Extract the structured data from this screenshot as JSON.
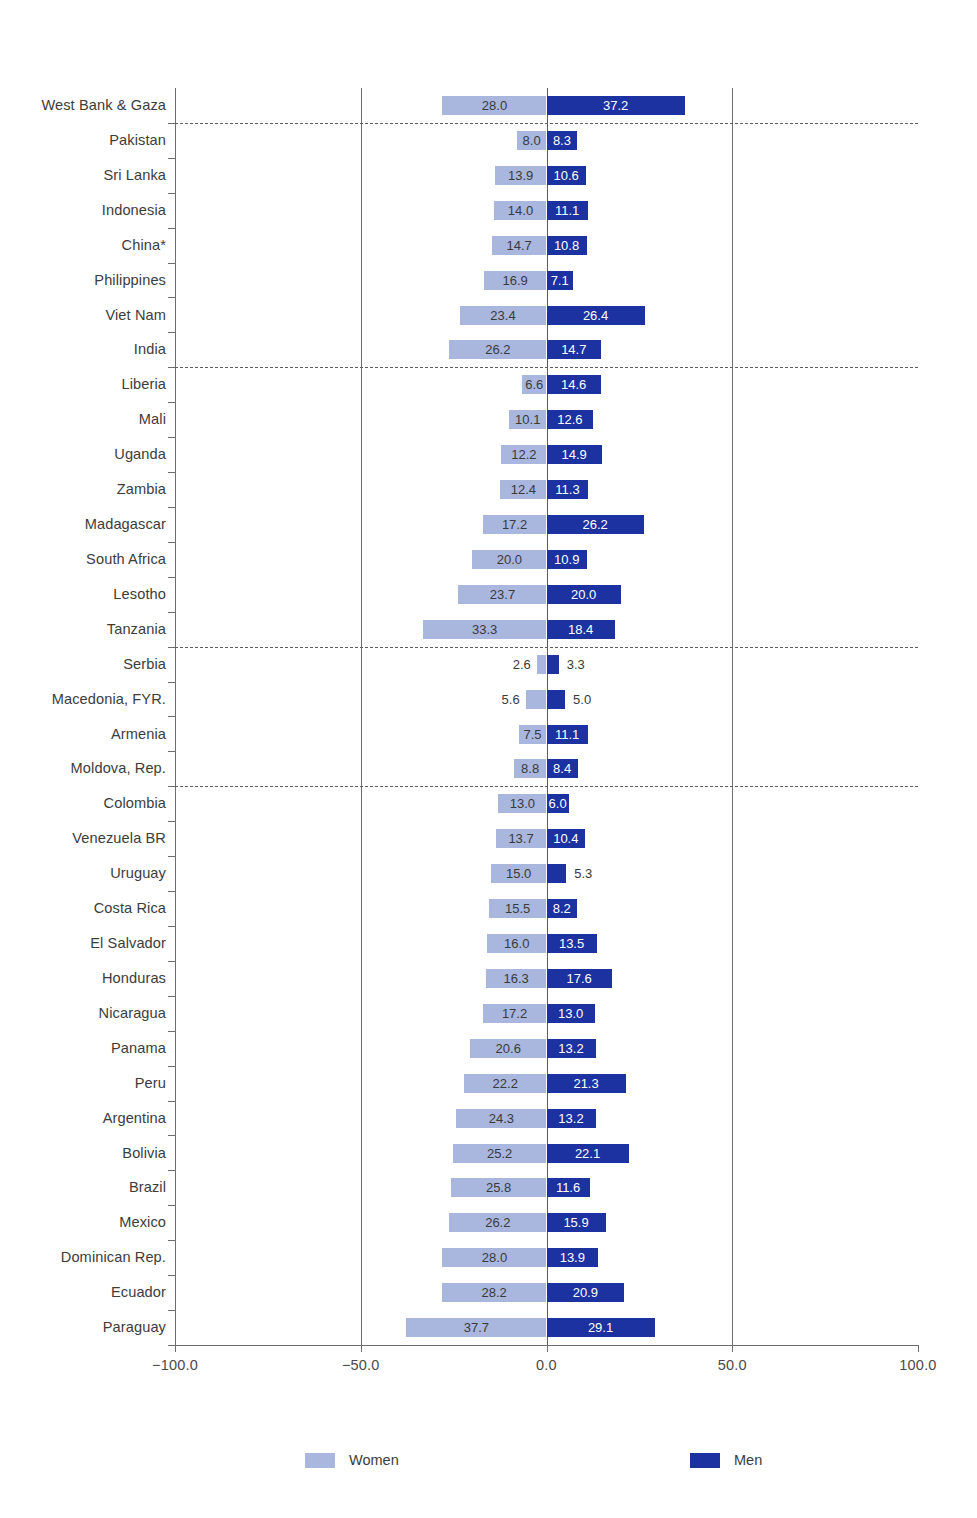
{
  "chart_data": {
    "type": "bar",
    "subtype": "diverging-horizontal-population-pyramid",
    "title": "",
    "subtitle": "",
    "xlabel": "",
    "ylabel": "",
    "xlim": [
      -100.0,
      100.0
    ],
    "xticks": [
      -100.0,
      -50.0,
      0.0,
      50.0,
      100.0
    ],
    "xticklabels": [
      "−100.0",
      "−50.0",
      "0.0",
      "50.0",
      "100.0"
    ],
    "grid": true,
    "gridlines_at": [
      -50.0,
      0.0,
      50.0
    ],
    "legend_position": "bottom",
    "series": [
      {
        "name": "Women",
        "color": "#a9b6de",
        "side": "left"
      },
      {
        "name": "Men",
        "color": "#1b32a0",
        "side": "right"
      }
    ],
    "categories": [
      "West Bank & Gaza",
      "Pakistan",
      "Sri Lanka",
      "Indonesia",
      "China*",
      "Philippines",
      "Viet Nam",
      "India",
      "Liberia",
      "Mali",
      "Uganda",
      "Zambia",
      "Madagascar",
      "South Africa",
      "Lesotho",
      "Tanzania",
      "Serbia",
      "Macedonia, FYR.",
      "Armenia",
      "Moldova, Rep.",
      "Colombia",
      "Venezuela BR",
      "Uruguay",
      "Costa Rica",
      "El Salvador",
      "Honduras",
      "Nicaragua",
      "Panama",
      "Peru",
      "Argentina",
      "Bolivia",
      "Brazil",
      "Mexico",
      "Dominican Rep.",
      "Ecuador",
      "Paraguay"
    ],
    "women": [
      28.0,
      8.0,
      13.9,
      14.0,
      14.7,
      16.9,
      23.4,
      26.2,
      6.6,
      10.1,
      12.2,
      12.4,
      17.2,
      20.0,
      23.7,
      33.3,
      2.6,
      5.6,
      7.5,
      8.8,
      13.0,
      13.7,
      15.0,
      15.5,
      16.0,
      16.3,
      17.2,
      20.6,
      22.2,
      24.3,
      25.2,
      25.8,
      26.2,
      28.0,
      28.2,
      37.7
    ],
    "men": [
      37.2,
      8.3,
      10.6,
      11.1,
      10.8,
      7.1,
      26.4,
      14.7,
      14.6,
      12.6,
      14.9,
      11.3,
      26.2,
      10.9,
      20.0,
      18.4,
      3.3,
      5.0,
      11.1,
      8.4,
      6.0,
      10.4,
      5.3,
      8.2,
      13.5,
      17.6,
      13.0,
      13.2,
      21.3,
      13.2,
      22.1,
      11.6,
      15.9,
      13.9,
      20.9,
      29.1
    ],
    "group_separators_after": [
      "West Bank & Gaza",
      "India",
      "Tanzania",
      "Moldova, Rep."
    ],
    "labels_outside_bar": {
      "women": [
        "Serbia",
        "Macedonia, FYR."
      ],
      "men": [
        "Serbia",
        "Macedonia, FYR.",
        "Uruguay"
      ]
    },
    "annotations": [
      "China*"
    ]
  },
  "legend": {
    "women_label": "Women",
    "men_label": "Men"
  },
  "colors": {
    "women": "#a9b6de",
    "men": "#1b32a0",
    "axis": "#6d6d6d",
    "text": "#3c3c3c",
    "background": "#ffffff"
  }
}
